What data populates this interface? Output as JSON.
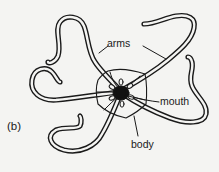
{
  "figure": {
    "panel_label": "(b)",
    "labels": {
      "arms": "arms",
      "mouth": "mouth",
      "body": "body"
    },
    "colors": {
      "background": "#f4f4f2",
      "stroke": "#1a1a1a",
      "arm_fill": "#f4f4f2",
      "mouth_fill": "#111111"
    }
  }
}
